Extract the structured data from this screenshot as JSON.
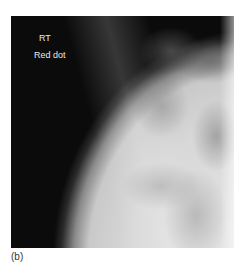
{
  "figure": {
    "panel_label": "(b)",
    "image": {
      "type": "radiograph",
      "subject": "shoulder x-ray",
      "annotations": [
        {
          "text": "RT"
        },
        {
          "text": "Red dot"
        }
      ]
    }
  }
}
